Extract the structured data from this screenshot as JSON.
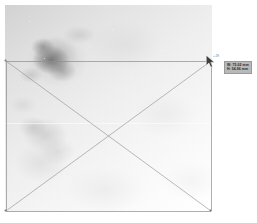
{
  "app": {
    "name": "image-measurement-overlay",
    "canvas_background": "#ffffff"
  },
  "image": {
    "name": "grayscale-scan",
    "alt_description": "Light grayscale scanned field with darker mottled region in the upper-left quadrant",
    "x": 5,
    "y": 5,
    "width": 207,
    "height": 207,
    "base_color": "#f2f2f2",
    "dark_region_color": "#8a8a8a"
  },
  "measurement": {
    "name": "selection-rectangle",
    "stroke_color": "#8d8d8d",
    "stroke_width": 0.7,
    "left": 6,
    "top": 61,
    "right": 211,
    "bottom": 211,
    "diagonals_visible": true,
    "center_x": 108.5,
    "center_y": 136
  },
  "cursor": {
    "name": "arrow-cursor",
    "x": 204,
    "y": 54,
    "color": "#3c3c3c"
  },
  "handle": {
    "label": "+ 29"
  },
  "tooltip": {
    "name": "dimension-readout",
    "background": "#b9b9b9",
    "border_color": "#9a9a9a",
    "text_color": "#1d1d1d",
    "lines": [
      "W: 75.02 mm",
      "H: 54.96 mm"
    ]
  }
}
